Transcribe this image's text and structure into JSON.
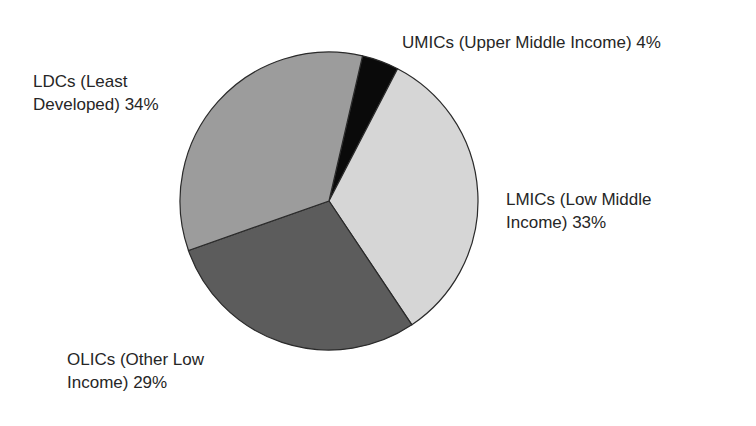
{
  "chart_data": {
    "type": "pie",
    "title": "",
    "start_angle_deg": 13,
    "direction": "clockwise",
    "center": [
      329,
      201
    ],
    "radius": 149,
    "slices": [
      {
        "key": "umic",
        "label": "UMICs (Upper Middle Income)",
        "value": 4,
        "color": "#0a0a0a"
      },
      {
        "key": "lmic",
        "label": "LMICs (Low Middle Income)",
        "value": 33,
        "color": "#d6d6d6"
      },
      {
        "key": "olic",
        "label": "OLICs (Other Low Income)",
        "value": 29,
        "color": "#5c5c5c"
      },
      {
        "key": "ldc",
        "label": "LDCs (Least Developed)",
        "value": 34,
        "color": "#9c9c9c"
      }
    ],
    "categories": [
      "UMICs (Upper Middle Income)",
      "LMICs (Low Middle Income)",
      "OLICs (Other Low Income)",
      "LDCs (Least Developed)"
    ],
    "values": [
      4,
      33,
      29,
      34
    ],
    "unit": "%",
    "stroke_color": "#2a2a2a"
  },
  "labels": {
    "umic": {
      "line1": "UMICs (Upper Middle Income) 4%"
    },
    "ldc": {
      "line1": "LDCs (Least",
      "line2": "Developed) 34%"
    },
    "lmic": {
      "line1": "LMICs (Low Middle",
      "line2": "Income) 33%"
    },
    "olic": {
      "line1": "OLICs (Other Low",
      "line2": "Income) 29%"
    }
  }
}
